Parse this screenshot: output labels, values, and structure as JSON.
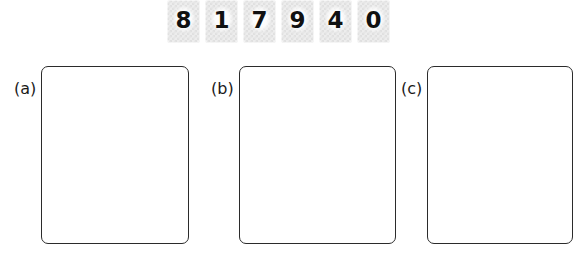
{
  "worksheet": {
    "background_color": "#ffffff",
    "tile_fill_color": "#ededed",
    "tile_pattern_color": "#e0e0e0",
    "digit_color": "#111111",
    "box_border_color": "#2b2b2b"
  },
  "tile_strip": {
    "name": "number-tiles",
    "tiles": [
      {
        "digit": "8"
      },
      {
        "digit": "1"
      },
      {
        "digit": "7"
      },
      {
        "digit": "9"
      },
      {
        "digit": "4"
      },
      {
        "digit": "0"
      }
    ]
  },
  "answer_boxes": [
    {
      "label": "(a)",
      "content": ""
    },
    {
      "label": "(b)",
      "content": ""
    },
    {
      "label": "(c)",
      "content": ""
    }
  ]
}
